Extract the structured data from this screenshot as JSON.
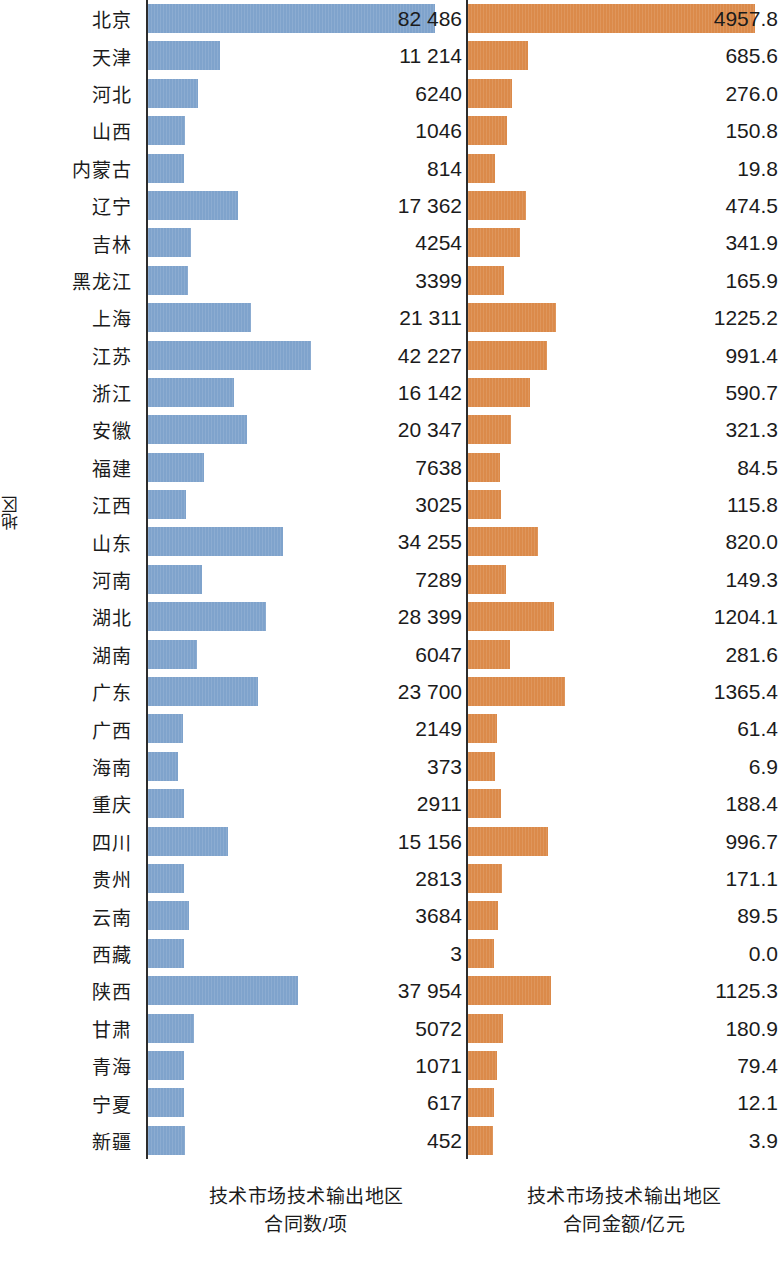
{
  "chart_data": {
    "type": "bar",
    "orientation": "horizontal",
    "title": "",
    "ylabel": "地区",
    "grid": false,
    "legend": "none",
    "panels": [
      {
        "name": "contracts",
        "xlabel_line1": "技术市场技术输出地区",
        "xlabel_line2": "合同数/项",
        "unit": "项",
        "color": "#7fa3cc",
        "xlim": [
          0,
          82486
        ]
      },
      {
        "name": "amount",
        "xlabel_line1": "技术市场技术输出地区",
        "xlabel_line2": "合同金额/亿元",
        "unit": "亿元",
        "color": "#db8a4a",
        "xlim": [
          0,
          4957.8
        ]
      }
    ],
    "categories": [
      "北京",
      "天津",
      "河北",
      "山西",
      "内蒙古",
      "辽宁",
      "吉林",
      "黑龙江",
      "上海",
      "江苏",
      "浙江",
      "安徽",
      "福建",
      "江西",
      "山东",
      "河南",
      "湖北",
      "湖南",
      "广东",
      "广西",
      "海南",
      "重庆",
      "四川",
      "贵州",
      "云南",
      "西藏",
      "陕西",
      "甘肃",
      "青海",
      "宁夏",
      "新疆"
    ],
    "series": [
      {
        "name": "技术市场技术输出地区合同数/项",
        "color": "#7fa3cc",
        "values": [
          82486,
          11214,
          6240,
          1046,
          814,
          17362,
          4254,
          3399,
          21311,
          42227,
          16142,
          20347,
          7638,
          3025,
          34255,
          7289,
          28399,
          6047,
          23700,
          2149,
          373,
          2911,
          15156,
          2813,
          3684,
          3,
          37954,
          5072,
          1071,
          617,
          452
        ],
        "labels": [
          "82 486",
          "11 214",
          "6240",
          "1046",
          "814",
          "17 362",
          "4254",
          "3399",
          "21 311",
          "42 227",
          "16 142",
          "20 347",
          "7638",
          "3025",
          "34 255",
          "7289",
          "28 399",
          "6047",
          "23 700",
          "2149",
          "373",
          "2911",
          "15 156",
          "2813",
          "3684",
          "3",
          "37 954",
          "5072",
          "1071",
          "617",
          "452"
        ]
      },
      {
        "name": "技术市场技术输出地区合同金额/亿元",
        "color": "#db8a4a",
        "values": [
          4957.8,
          685.6,
          276.0,
          150.8,
          19.8,
          474.5,
          341.9,
          165.9,
          1225.2,
          991.4,
          590.7,
          321.3,
          84.5,
          115.8,
          820.0,
          149.3,
          1204.1,
          281.6,
          1365.4,
          61.4,
          6.9,
          188.4,
          996.7,
          171.1,
          89.5,
          0.0,
          1125.3,
          180.9,
          79.4,
          12.1,
          3.9
        ],
        "labels": [
          "4957.8",
          "685.6",
          "276.0",
          "150.8",
          "19.8",
          "474.5",
          "341.9",
          "165.9",
          "1225.2",
          "991.4",
          "590.7",
          "321.3",
          "84.5",
          "115.8",
          "820.0",
          "149.3",
          "1204.1",
          "281.6",
          "1365.4",
          "61.4",
          "6.9",
          "188.4",
          "996.7",
          "171.1",
          "89.5",
          "0.0",
          "1125.3",
          "180.9",
          "79.4",
          "12.1",
          "3.9"
        ]
      }
    ],
    "bar_pixel_widths": {
      "note": "rendered bar lengths in px as measured from the source figure",
      "contracts": [
        287,
        72,
        50,
        37,
        36,
        90,
        43,
        40,
        103,
        163,
        86,
        99,
        56,
        38,
        135,
        54,
        118,
        49,
        110,
        35,
        30,
        36,
        80,
        36,
        41,
        36,
        150,
        46,
        36,
        36,
        37
      ],
      "amount": [
        287,
        60,
        44,
        39,
        27,
        58,
        52,
        36,
        88,
        79,
        62,
        43,
        32,
        33,
        70,
        38,
        86,
        42,
        97,
        29,
        27,
        33,
        80,
        34,
        30,
        26,
        83,
        35,
        29,
        26,
        25
      ]
    }
  },
  "axis": {
    "ylabel": "地区"
  }
}
